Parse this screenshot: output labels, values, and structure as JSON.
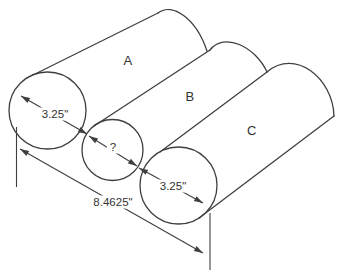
{
  "figure": {
    "colors": {
      "background": "#ffffff",
      "line": "#3f3f3f",
      "text": "#333333"
    },
    "cylinders": {
      "a": {
        "label": "A"
      },
      "b": {
        "label": "B"
      },
      "c": {
        "label": "C"
      }
    },
    "dimensions": {
      "cylinder_a_diameter": "3.25\"",
      "cylinder_b_diameter": "?",
      "cylinder_c_diameter": "3.25\"",
      "overall_width": "8.4625\""
    }
  }
}
